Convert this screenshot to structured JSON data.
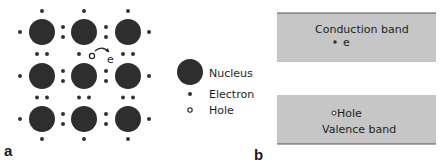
{
  "panel_a": {
    "label": "a",
    "lattice": {
      "nuclei_x": [
        42,
        84,
        128
      ],
      "nuclei_y": [
        32,
        76,
        119
      ],
      "nucleus_radius": 13,
      "electron_radius": 2,
      "moving_electron_label": "e"
    },
    "legend": {
      "items": [
        {
          "symbol": "nucleus",
          "label": "Nucleus"
        },
        {
          "symbol": "electron",
          "label": "Electron"
        },
        {
          "symbol": "hole",
          "label": "Hole"
        }
      ]
    }
  },
  "panel_b": {
    "label": "b",
    "conduction_band": {
      "label": "Conduction band",
      "electron_label": "e"
    },
    "valence_band": {
      "label": "Valence band",
      "hole_label": "Hole"
    }
  },
  "colors": {
    "nucleus": "#2e2e2e",
    "electron": "#333333",
    "band_fill": "#c6c6c6",
    "band_edge": "#555555",
    "text": "#1e1e1e"
  }
}
